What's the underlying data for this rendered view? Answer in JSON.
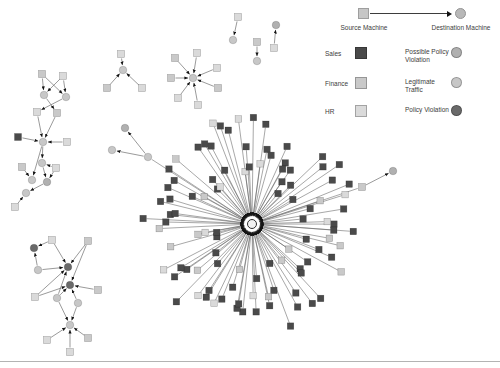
{
  "canvas": {
    "width": 500,
    "height": 368,
    "background": "#ffffff"
  },
  "palette": {
    "sales": "#4a4a4a",
    "finance": "#c9c9c9",
    "hr": "#dadada",
    "possible": "#b0b0b0",
    "legit": "#c7c7c7",
    "violation": "#6a6a6a",
    "hub_center_fill": "#f2f2f2",
    "hub_center_stroke": "#2f2f2f",
    "edge": "#6e6e6e",
    "arrow": "#141414",
    "source_swatch": "#c6c6c6",
    "destination_swatch": "#b8b8b8",
    "bottom_rule": "#b3b3b3"
  },
  "legend": {
    "flow": {
      "source_label": "Source Machine",
      "destination_label": "Destination Machine",
      "source_shape": "square",
      "destination_shape": "circle"
    },
    "categories": [
      {
        "label": "Sales",
        "color_key": "sales",
        "shape": "square"
      },
      {
        "label": "Finance",
        "color_key": "finance",
        "shape": "square"
      },
      {
        "label": "HR",
        "color_key": "hr",
        "shape": "square"
      }
    ],
    "statuses": [
      {
        "label": "Possible Policy Violation",
        "color_key": "possible",
        "shape": "circle"
      },
      {
        "label": "Legitimate Traffic",
        "color_key": "legit",
        "shape": "circle"
      },
      {
        "label": "Policy Violation",
        "color_key": "violation",
        "shape": "circle"
      }
    ]
  },
  "graph": {
    "hub": {
      "center_x": 252,
      "center_y": 224,
      "spokes": 100,
      "radius_min": 36,
      "radius_max": 110,
      "seed": 11,
      "weights": {
        "sales": 0.68,
        "finance": 0.85,
        "hr": 1.0
      },
      "center_links": [
        {
          "x": 148,
          "y": 157
        },
        {
          "x": 362,
          "y": 187
        }
      ]
    },
    "nodes": [
      [
        "t1",
        42,
        74,
        "s",
        "finance"
      ],
      [
        "t2",
        63,
        76,
        "s",
        "hr"
      ],
      [
        "t3",
        44,
        95,
        "c",
        "legit"
      ],
      [
        "t4",
        66,
        97,
        "c",
        "legit"
      ],
      [
        "t5",
        37,
        112,
        "s",
        "hr"
      ],
      [
        "t6",
        57,
        113,
        "s",
        "finance"
      ],
      [
        "t7",
        18,
        137,
        "s",
        "sales"
      ],
      [
        "t8",
        43,
        142,
        "c",
        "legit"
      ],
      [
        "t9",
        67,
        142,
        "s",
        "hr"
      ],
      [
        "t10",
        22,
        167,
        "s",
        "finance"
      ],
      [
        "t11",
        42,
        163,
        "c",
        "legit"
      ],
      [
        "t12",
        56,
        168,
        "s",
        "hr"
      ],
      [
        "t13",
        32,
        180,
        "c",
        "legit"
      ],
      [
        "t14",
        47,
        182,
        "c",
        "possible"
      ],
      [
        "t15",
        26,
        193,
        "c",
        "legit"
      ],
      [
        "t16",
        15,
        207,
        "s",
        "hr"
      ],
      [
        "b1",
        52,
        240,
        "s",
        "hr"
      ],
      [
        "b2",
        88,
        241,
        "s",
        "finance"
      ],
      [
        "b3",
        34,
        248,
        "c",
        "violation"
      ],
      [
        "b4",
        68,
        267,
        "c",
        "violation"
      ],
      [
        "b5",
        38,
        270,
        "c",
        "legit"
      ],
      [
        "b6",
        70,
        285,
        "c",
        "violation"
      ],
      [
        "b7",
        98,
        290,
        "s",
        "finance"
      ],
      [
        "b8",
        35,
        297,
        "s",
        "hr"
      ],
      [
        "b9",
        57,
        298,
        "c",
        "legit"
      ],
      [
        "b10",
        78,
        303,
        "c",
        "legit"
      ],
      [
        "b11",
        70,
        325,
        "c",
        "legit"
      ],
      [
        "b12",
        47,
        340,
        "s",
        "hr"
      ],
      [
        "b13",
        88,
        338,
        "s",
        "finance"
      ],
      [
        "b14",
        70,
        352,
        "s",
        "hr"
      ],
      [
        "g0",
        123,
        70,
        "c",
        "legit"
      ],
      [
        "g1",
        121,
        54,
        "s",
        "hr"
      ],
      [
        "g2",
        107,
        88,
        "s",
        "finance"
      ],
      [
        "g3",
        142,
        88,
        "s",
        "hr"
      ],
      [
        "h0",
        193,
        78,
        "c",
        "legit"
      ],
      [
        "h1",
        197,
        53,
        "s",
        "hr"
      ],
      [
        "h2",
        175,
        58,
        "s",
        "finance"
      ],
      [
        "h3",
        171,
        78,
        "s",
        "finance"
      ],
      [
        "h4",
        178,
        98,
        "s",
        "hr"
      ],
      [
        "h5",
        198,
        105,
        "s",
        "hr"
      ],
      [
        "h6",
        218,
        88,
        "s",
        "finance"
      ],
      [
        "h7",
        217,
        68,
        "s",
        "hr"
      ],
      [
        "p1a",
        238,
        17,
        "s",
        "hr"
      ],
      [
        "p1b",
        233,
        40,
        "c",
        "legit"
      ],
      [
        "p2a",
        257,
        42,
        "s",
        "finance"
      ],
      [
        "p2b",
        257,
        61,
        "c",
        "legit"
      ],
      [
        "p3a",
        274,
        48,
        "s",
        "hr"
      ],
      [
        "p3b",
        276,
        25,
        "c",
        "possible"
      ],
      [
        "m1",
        148,
        157,
        "c",
        "legit"
      ],
      [
        "m2",
        125,
        128,
        "c",
        "possible"
      ],
      [
        "m3",
        112,
        150,
        "c",
        "legit"
      ],
      [
        "r1",
        362,
        187,
        "s",
        "finance"
      ],
      [
        "r2",
        393,
        171,
        "c",
        "possible"
      ]
    ],
    "edges": [
      [
        "t1",
        "t3"
      ],
      [
        "t1",
        "t4"
      ],
      [
        "t2",
        "t3"
      ],
      [
        "t2",
        "t4"
      ],
      [
        "t3",
        "t6"
      ],
      [
        "t4",
        "t5"
      ],
      [
        "t5",
        "t8"
      ],
      [
        "t6",
        "t8"
      ],
      [
        "t7",
        "t8"
      ],
      [
        "t9",
        "t8"
      ],
      [
        "t8",
        "t11"
      ],
      [
        "t8",
        "t13"
      ],
      [
        "t10",
        "t13"
      ],
      [
        "t11",
        "t14"
      ],
      [
        "t12",
        "t14"
      ],
      [
        "t12",
        "t11"
      ],
      [
        "t14",
        "t15"
      ],
      [
        "t16",
        "t15"
      ],
      [
        "b1",
        "b3"
      ],
      [
        "b1",
        "b4"
      ],
      [
        "b2",
        "b4"
      ],
      [
        "b2",
        "b6"
      ],
      [
        "b5",
        "b3"
      ],
      [
        "b5",
        "b4"
      ],
      [
        "b7",
        "b6"
      ],
      [
        "b8",
        "b4"
      ],
      [
        "b8",
        "b6"
      ],
      [
        "b9",
        "b4"
      ],
      [
        "b9",
        "b6"
      ],
      [
        "b10",
        "b6"
      ],
      [
        "b9",
        "b11"
      ],
      [
        "b10",
        "b11"
      ],
      [
        "b12",
        "b11"
      ],
      [
        "b13",
        "b11"
      ],
      [
        "b14",
        "b11"
      ],
      [
        "g1",
        "g0"
      ],
      [
        "g2",
        "g0"
      ],
      [
        "g3",
        "g0"
      ],
      [
        "h1",
        "h0"
      ],
      [
        "h2",
        "h0"
      ],
      [
        "h3",
        "h0"
      ],
      [
        "h4",
        "h0"
      ],
      [
        "h5",
        "h0"
      ],
      [
        "h6",
        "h0"
      ],
      [
        "h7",
        "h0"
      ],
      [
        "p1a",
        "p1b"
      ],
      [
        "p2a",
        "p2b"
      ],
      [
        "p3a",
        "p3b"
      ],
      [
        "m1",
        "m2"
      ],
      [
        "m1",
        "m3"
      ],
      [
        "r1",
        "r2"
      ]
    ]
  }
}
